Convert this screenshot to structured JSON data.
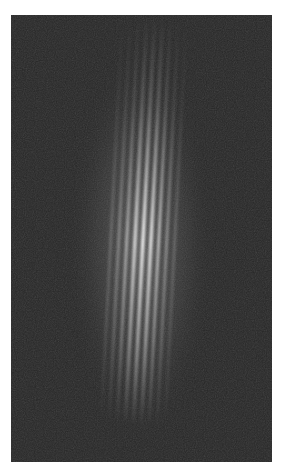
{
  "image": {
    "description": "Grayscale photograph of vertical interference fringes on a dark background",
    "background_color": "#262626",
    "fringe_color": "#e8e8e8",
    "page_color": "#ffffff",
    "fringe_count_visible": 9,
    "fringe_spacing_px": 8,
    "frame": {
      "left": 11,
      "top": 15,
      "width": 261,
      "height": 447
    }
  }
}
